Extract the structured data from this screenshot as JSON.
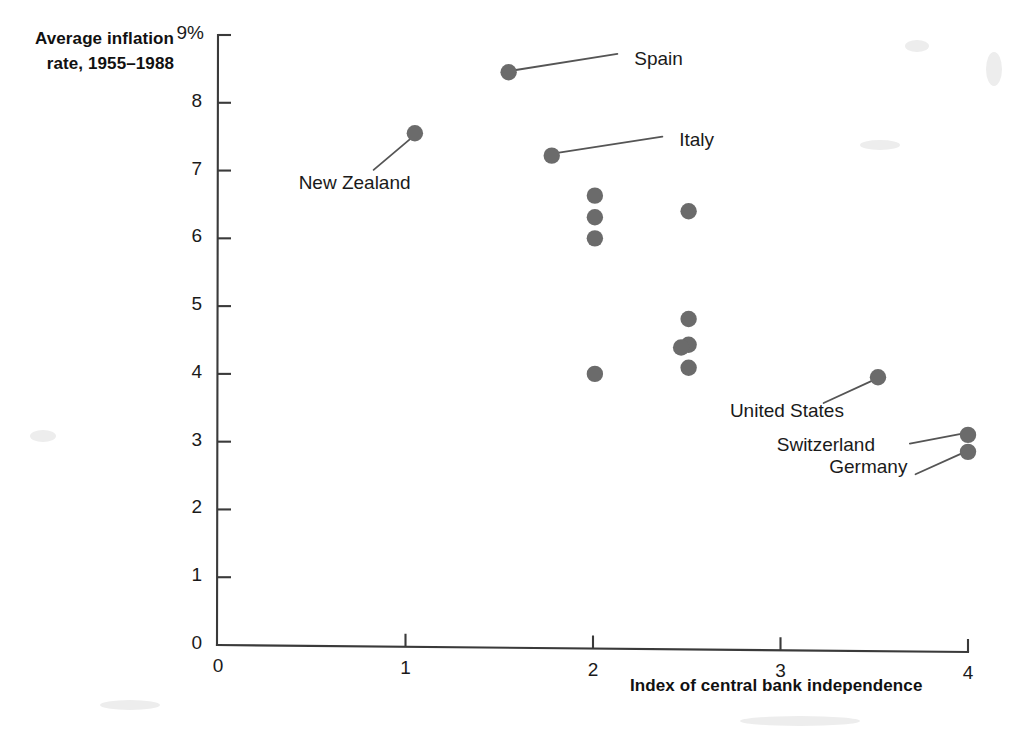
{
  "chart_data": {
    "type": "scatter",
    "title": "",
    "ylabel": "Average inflation rate, 1955–1988",
    "xlabel": "Index of central bank independence",
    "xlim": [
      0,
      4
    ],
    "ylim": [
      0,
      9
    ],
    "xticks": [
      "0",
      "1",
      "2",
      "3",
      "4"
    ],
    "yticks": [
      "0",
      "1",
      "2",
      "3",
      "4",
      "5",
      "6",
      "7",
      "8",
      "9%"
    ],
    "grid": false,
    "legend": null,
    "marker_color": "#6b6b6b",
    "axis_color": "#3a3a3a",
    "points": [
      {
        "x": 1.55,
        "y": 8.45,
        "label": "Spain",
        "label_x": 2.22,
        "label_y": 8.62
      },
      {
        "x": 1.05,
        "y": 7.55,
        "label": "New Zealand",
        "label_x": 0.43,
        "label_y": 6.78
      },
      {
        "x": 1.78,
        "y": 7.22,
        "label": "Italy",
        "label_x": 2.46,
        "label_y": 7.42
      },
      {
        "x": 2.01,
        "y": 6.63,
        "label": null
      },
      {
        "x": 2.01,
        "y": 6.31,
        "label": null
      },
      {
        "x": 2.01,
        "y": 6.0,
        "label": null
      },
      {
        "x": 2.51,
        "y": 6.4,
        "label": null
      },
      {
        "x": 2.51,
        "y": 4.81,
        "label": null
      },
      {
        "x": 2.51,
        "y": 4.43,
        "label": null
      },
      {
        "x": 2.47,
        "y": 4.39,
        "label": null
      },
      {
        "x": 2.51,
        "y": 4.09,
        "label": null
      },
      {
        "x": 2.01,
        "y": 4.0,
        "label": null
      },
      {
        "x": 3.52,
        "y": 3.95,
        "label": "United States",
        "label_x": 2.73,
        "label_y": 3.42
      },
      {
        "x": 4.0,
        "y": 3.1,
        "label": "Switzerland",
        "label_x": 2.98,
        "label_y": 2.92
      },
      {
        "x": 4.0,
        "y": 2.85,
        "label": "Germany",
        "label_x": 3.26,
        "label_y": 2.6
      }
    ],
    "annotations": [
      {
        "text": "Spain",
        "leader_from": [
          1.58,
          8.48
        ],
        "leader_to": [
          2.13,
          8.72
        ]
      },
      {
        "text": "New Zealand",
        "leader_from": [
          1.04,
          7.5
        ],
        "leader_to": [
          0.83,
          7.01
        ]
      },
      {
        "text": "Italy",
        "leader_from": [
          1.81,
          7.26
        ],
        "leader_to": [
          2.37,
          7.5
        ]
      },
      {
        "text": "United States",
        "leader_from": [
          3.49,
          3.9
        ],
        "leader_to": [
          3.23,
          3.57
        ]
      },
      {
        "text": "Switzerland",
        "leader_from": [
          3.97,
          3.12
        ],
        "leader_to": [
          3.69,
          2.97
        ]
      },
      {
        "text": "Germany",
        "leader_from": [
          3.97,
          2.83
        ],
        "leader_to": [
          3.72,
          2.52
        ]
      }
    ]
  }
}
